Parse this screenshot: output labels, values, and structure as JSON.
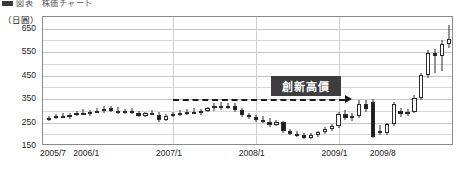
{
  "caption": {
    "text": "図表　株価チャート"
  },
  "chart_data": {
    "type": "candlestick",
    "title": "",
    "subtitle": "",
    "xlabel": "",
    "ylabel": "",
    "unit_label": "（日圓）",
    "ylim": [
      150,
      700
    ],
    "y_major_ticks": [
      650,
      550,
      450,
      350,
      250,
      150
    ],
    "y_minor_ticks": [
      700,
      600,
      500,
      400,
      300,
      200
    ],
    "grid": true,
    "legend": null,
    "x_tick_labels": [
      "2005/7",
      "2006/1",
      "2007/1",
      "2008/1",
      "2009/1",
      "2009/8"
    ],
    "x_tick_positions": [
      0,
      6,
      18,
      30,
      42,
      49
    ],
    "n_points": 50,
    "annotations": [
      {
        "name": "new-high-label",
        "text": "創新高價",
        "kind": "box",
        "color": "#3d3d3d",
        "text_color": "#ffffff"
      },
      {
        "name": "resistance-line",
        "kind": "dashed-horizontal-arrow",
        "value": 350,
        "from_index": 18,
        "to_index": 43,
        "color": "#1a1a1a"
      }
    ],
    "colors": {
      "up_body": "#ffffff",
      "down_body": "#1c1c1c",
      "outline": "#2b2b2b",
      "grid": "#d8d8d8",
      "frame": "#8a8a8a",
      "annotation_bg": "#3d3d3d"
    },
    "candles": [
      {
        "label": "2005/7",
        "open": 264,
        "high": 278,
        "low": 258,
        "close": 270,
        "dir": "up"
      },
      {
        "label": "2005/8",
        "open": 270,
        "high": 288,
        "low": 264,
        "close": 276,
        "dir": "up"
      },
      {
        "label": "2005/9",
        "open": 276,
        "high": 292,
        "low": 270,
        "close": 272,
        "dir": "down"
      },
      {
        "label": "2005/10",
        "open": 272,
        "high": 292,
        "low": 266,
        "close": 284,
        "dir": "up"
      },
      {
        "label": "2005/11",
        "open": 284,
        "high": 300,
        "low": 278,
        "close": 290,
        "dir": "up"
      },
      {
        "label": "2005/12",
        "open": 290,
        "high": 306,
        "low": 282,
        "close": 286,
        "dir": "down"
      },
      {
        "label": "2006/1",
        "open": 286,
        "high": 304,
        "low": 278,
        "close": 296,
        "dir": "up"
      },
      {
        "label": "2006/2",
        "open": 296,
        "high": 314,
        "low": 290,
        "close": 300,
        "dir": "up"
      },
      {
        "label": "2006/3",
        "open": 300,
        "high": 320,
        "low": 292,
        "close": 306,
        "dir": "up"
      },
      {
        "label": "2006/4",
        "open": 312,
        "high": 322,
        "low": 296,
        "close": 300,
        "dir": "down"
      },
      {
        "label": "2006/5",
        "open": 300,
        "high": 316,
        "low": 288,
        "close": 294,
        "dir": "down"
      },
      {
        "label": "2006/6",
        "open": 294,
        "high": 308,
        "low": 286,
        "close": 300,
        "dir": "up"
      },
      {
        "label": "2006/7",
        "open": 300,
        "high": 312,
        "low": 288,
        "close": 292,
        "dir": "down"
      },
      {
        "label": "2006/8",
        "open": 292,
        "high": 300,
        "low": 274,
        "close": 280,
        "dir": "down"
      },
      {
        "label": "2006/9",
        "open": 280,
        "high": 296,
        "low": 272,
        "close": 290,
        "dir": "up"
      },
      {
        "label": "2006/10",
        "open": 290,
        "high": 304,
        "low": 282,
        "close": 284,
        "dir": "down"
      },
      {
        "label": "2006/11",
        "open": 284,
        "high": 296,
        "low": 254,
        "close": 262,
        "dir": "down"
      },
      {
        "label": "2006/12",
        "open": 262,
        "high": 286,
        "low": 258,
        "close": 280,
        "dir": "up"
      },
      {
        "label": "2007/1",
        "open": 280,
        "high": 296,
        "low": 272,
        "close": 286,
        "dir": "up"
      },
      {
        "label": "2007/2",
        "open": 286,
        "high": 302,
        "low": 278,
        "close": 290,
        "dir": "up"
      },
      {
        "label": "2007/3",
        "open": 290,
        "high": 306,
        "low": 282,
        "close": 296,
        "dir": "up"
      },
      {
        "label": "2007/4",
        "open": 296,
        "high": 312,
        "low": 288,
        "close": 292,
        "dir": "down"
      },
      {
        "label": "2007/5",
        "open": 292,
        "high": 308,
        "low": 284,
        "close": 300,
        "dir": "up"
      },
      {
        "label": "2007/6",
        "open": 300,
        "high": 318,
        "low": 294,
        "close": 312,
        "dir": "up"
      },
      {
        "label": "2007/7",
        "open": 312,
        "high": 334,
        "low": 300,
        "close": 320,
        "dir": "up"
      },
      {
        "label": "2007/8",
        "open": 320,
        "high": 336,
        "low": 304,
        "close": 314,
        "dir": "down"
      },
      {
        "label": "2007/9",
        "open": 314,
        "high": 332,
        "low": 306,
        "close": 322,
        "dir": "up"
      },
      {
        "label": "2007/10",
        "open": 322,
        "high": 334,
        "low": 296,
        "close": 302,
        "dir": "down"
      },
      {
        "label": "2007/11",
        "open": 302,
        "high": 312,
        "low": 272,
        "close": 282,
        "dir": "down"
      },
      {
        "label": "2007/12",
        "open": 282,
        "high": 292,
        "low": 266,
        "close": 272,
        "dir": "down"
      },
      {
        "label": "2008/1",
        "open": 272,
        "high": 282,
        "low": 254,
        "close": 262,
        "dir": "down"
      },
      {
        "label": "2008/2",
        "open": 262,
        "high": 276,
        "low": 248,
        "close": 254,
        "dir": "down"
      },
      {
        "label": "2008/3",
        "open": 254,
        "high": 268,
        "low": 232,
        "close": 240,
        "dir": "down"
      },
      {
        "label": "2008/4",
        "open": 240,
        "high": 262,
        "low": 234,
        "close": 252,
        "dir": "up"
      },
      {
        "label": "2008/5",
        "open": 252,
        "high": 258,
        "low": 206,
        "close": 214,
        "dir": "down"
      },
      {
        "label": "2008/6",
        "open": 214,
        "high": 224,
        "low": 196,
        "close": 202,
        "dir": "down"
      },
      {
        "label": "2008/7",
        "open": 202,
        "high": 214,
        "low": 188,
        "close": 196,
        "dir": "down"
      },
      {
        "label": "2008/8",
        "open": 196,
        "high": 206,
        "low": 180,
        "close": 186,
        "dir": "down"
      },
      {
        "label": "2008/9",
        "open": 186,
        "high": 204,
        "low": 178,
        "close": 198,
        "dir": "up"
      },
      {
        "label": "2008/10",
        "open": 198,
        "high": 216,
        "low": 190,
        "close": 208,
        "dir": "up"
      },
      {
        "label": "2008/11",
        "open": 208,
        "high": 232,
        "low": 202,
        "close": 222,
        "dir": "up"
      },
      {
        "label": "2008/12",
        "open": 222,
        "high": 244,
        "low": 214,
        "close": 236,
        "dir": "up"
      },
      {
        "label": "2009/1",
        "open": 236,
        "high": 296,
        "low": 228,
        "close": 288,
        "dir": "up"
      },
      {
        "label": "2009/2",
        "open": 288,
        "high": 302,
        "low": 262,
        "close": 270,
        "dir": "down"
      },
      {
        "label": "2009/3",
        "open": 270,
        "high": 290,
        "low": 258,
        "close": 278,
        "dir": "up"
      },
      {
        "label": "2009/4",
        "open": 278,
        "high": 344,
        "low": 268,
        "close": 330,
        "dir": "up"
      },
      {
        "label": "2009/5",
        "open": 330,
        "high": 348,
        "low": 296,
        "close": 306,
        "dir": "down"
      },
      {
        "label": "2009/6",
        "open": 338,
        "high": 350,
        "low": 184,
        "close": 190,
        "dir": "down"
      },
      {
        "label": "2009/7",
        "open": 214,
        "high": 238,
        "low": 196,
        "close": 206,
        "dir": "down"
      },
      {
        "label": "2009/8",
        "open": 206,
        "high": 250,
        "low": 198,
        "close": 242,
        "dir": "up"
      },
      {
        "label": "2009/9",
        "open": 242,
        "high": 336,
        "low": 236,
        "close": 328,
        "dir": "up"
      },
      {
        "label": "2009/10",
        "open": 298,
        "high": 312,
        "low": 274,
        "close": 286,
        "dir": "down"
      },
      {
        "label": "2009/11",
        "open": 286,
        "high": 306,
        "low": 276,
        "close": 296,
        "dir": "up"
      },
      {
        "label": "2009/12",
        "open": 296,
        "high": 366,
        "low": 290,
        "close": 356,
        "dir": "up"
      },
      {
        "label": "2010/1",
        "open": 356,
        "high": 460,
        "low": 348,
        "close": 452,
        "dir": "up"
      },
      {
        "label": "2010/2",
        "open": 452,
        "high": 560,
        "low": 440,
        "close": 548,
        "dir": "up"
      },
      {
        "label": "2010/3",
        "open": 548,
        "high": 562,
        "low": 462,
        "close": 534,
        "dir": "down"
      },
      {
        "label": "2010/4",
        "open": 534,
        "high": 600,
        "low": 470,
        "close": 584,
        "dir": "up"
      },
      {
        "label": "2010/5",
        "open": 584,
        "high": 668,
        "low": 568,
        "close": 606,
        "dir": "up"
      }
    ]
  }
}
